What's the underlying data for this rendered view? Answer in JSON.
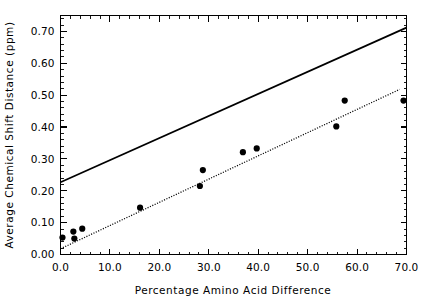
{
  "chart_data": {
    "type": "scatter",
    "title": "",
    "xlabel": "Percentage Amino Acid Difference",
    "ylabel": "Average Chemical Shift Distance (ppm)",
    "xlim": [
      0.0,
      70.0
    ],
    "ylim": [
      0.0,
      0.75
    ],
    "grid": false,
    "legend": "none",
    "xticks": [
      0.0,
      10.0,
      20.0,
      30.0,
      40.0,
      50.0,
      60.0,
      70.0
    ],
    "xtick_labels": [
      "0.0",
      "10.0",
      "20.0",
      "30.0",
      "40.0",
      "50.0",
      "60.0",
      "70.0"
    ],
    "xminor_interval": 2.0,
    "yticks": [
      0.0,
      0.1,
      0.2,
      0.3,
      0.4,
      0.5,
      0.6,
      0.7
    ],
    "ytick_labels": [
      "0.00",
      "0.10",
      "0.20",
      "0.30",
      "0.40",
      "0.50",
      "0.60",
      "0.70"
    ],
    "yminor_interval": 0.02,
    "points": [
      {
        "x": 0.4,
        "y": 0.053
      },
      {
        "x": 2.6,
        "y": 0.072
      },
      {
        "x": 2.8,
        "y": 0.05
      },
      {
        "x": 4.4,
        "y": 0.081
      },
      {
        "x": 16.1,
        "y": 0.147
      },
      {
        "x": 28.2,
        "y": 0.215
      },
      {
        "x": 28.8,
        "y": 0.265
      },
      {
        "x": 36.9,
        "y": 0.321
      },
      {
        "x": 39.7,
        "y": 0.333
      },
      {
        "x": 55.8,
        "y": 0.402
      },
      {
        "x": 57.5,
        "y": 0.483
      },
      {
        "x": 69.4,
        "y": 0.483
      }
    ],
    "marker": {
      "shape": "circle",
      "size": 3.1,
      "color": "#000000"
    },
    "lines": [
      {
        "name": "upper-solid-line",
        "style": "solid",
        "color": "#000000",
        "x": [
          0.0,
          70.0
        ],
        "y": [
          0.227,
          0.712
        ]
      },
      {
        "name": "regression-dotted-line",
        "style": "dotted",
        "color": "#000000",
        "x": [
          0.0,
          68.6
        ],
        "y": [
          0.018,
          0.518
        ]
      }
    ],
    "frame": {
      "top": true,
      "right": true,
      "bottom": true,
      "left": true
    }
  },
  "axes": {
    "x_title": "Percentage Amino Acid Difference",
    "y_title": "Average Chemical Shift Distance (ppm)"
  }
}
